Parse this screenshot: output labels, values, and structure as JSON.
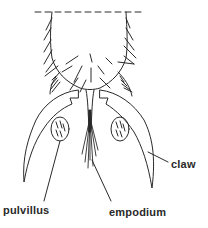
{
  "figure": {
    "labels": {
      "claw": "claw",
      "pulvillus": "pulvillus",
      "empodium": "empodium"
    },
    "colors": {
      "line": "#2a2a2a",
      "background": "#ffffff"
    }
  }
}
